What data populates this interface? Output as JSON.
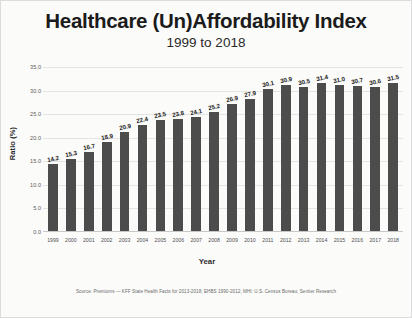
{
  "chart_data": {
    "type": "bar",
    "title": "Healthcare (Un)Affordability Index",
    "subtitle": "1999 to 2018",
    "xlabel": "Year",
    "ylabel": "Ratio (%)",
    "categories": [
      "1999",
      "2000",
      "2001",
      "2002",
      "2003",
      "2004",
      "2005",
      "2006",
      "2007",
      "2008",
      "2009",
      "2010",
      "2011",
      "2012",
      "2013",
      "2014",
      "2015",
      "2016",
      "2017",
      "2018"
    ],
    "values": [
      14.2,
      15.3,
      16.7,
      18.9,
      20.9,
      22.4,
      23.5,
      23.8,
      24.1,
      25.2,
      26.9,
      27.9,
      30.1,
      30.9,
      30.5,
      31.4,
      31.0,
      30.7,
      30.6,
      31.5
    ],
    "ylim": [
      0.0,
      35.0
    ],
    "ytick_step": 5.0,
    "yticks": [
      "0.0",
      "5.0",
      "10.0",
      "15.0",
      "20.0",
      "25.0",
      "30.0",
      "35.0"
    ],
    "grid": true,
    "legend": false,
    "bar_color": "#4c4c4c",
    "background_color": "#fbfbfa",
    "gridline_color": "#e4e4e2",
    "source_note": "Source: Premiums — KFF State Health Facts for 2013-2018; EHBS 1990-2012; MHI: U.S. Census Bureau; Sentier Research"
  }
}
